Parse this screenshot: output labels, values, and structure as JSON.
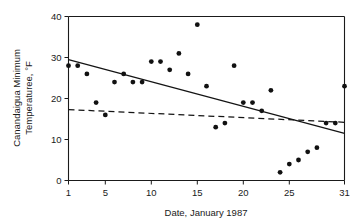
{
  "chart_data": {
    "type": "scatter",
    "title": "",
    "xlabel": "Date, January 1987",
    "ylabel": "Canandaigua Minimum Temperaturee, °F",
    "xlim": [
      1,
      31
    ],
    "ylim": [
      0,
      40
    ],
    "grid": false,
    "legend": "none",
    "x_ticks": [
      1,
      5,
      10,
      15,
      20,
      25,
      31
    ],
    "x_tick_labels": [
      "1",
      "5",
      "10",
      "15",
      "20",
      "25",
      "31"
    ],
    "y_ticks": [
      0,
      10,
      20,
      30,
      40
    ],
    "y_tick_labels": [
      "0",
      "10",
      "20",
      "30",
      "40"
    ],
    "series": [
      {
        "name": "Canandaigua minimum temperature",
        "marker": "filled-circle",
        "x": [
          1,
          2,
          3,
          4,
          5,
          6,
          7,
          8,
          9,
          10,
          11,
          12,
          13,
          14,
          15,
          16,
          17,
          18,
          19,
          20,
          21,
          22,
          23,
          24,
          25,
          26,
          27,
          28,
          29,
          30,
          31
        ],
        "y": [
          28,
          28,
          26,
          19,
          16,
          24,
          26,
          24,
          24,
          29,
          29,
          27,
          31,
          26,
          38,
          23,
          13,
          14,
          28,
          19,
          19,
          17,
          22,
          2,
          4,
          5,
          7,
          8,
          14,
          14,
          23
        ]
      }
    ],
    "annotations": [
      {
        "name": "regression-line-solid",
        "style": "solid",
        "x": [
          1,
          31
        ],
        "y": [
          29.5,
          11.5
        ]
      },
      {
        "name": "regression-line-dashed",
        "style": "dashed",
        "x": [
          1,
          31
        ],
        "y": [
          17.3,
          14.2
        ]
      }
    ]
  },
  "axes": {
    "x_title": "Date, January 1987",
    "y_title_line1": "Canandaigua Minimum",
    "y_title_line2": "Temperaturee, °F"
  }
}
